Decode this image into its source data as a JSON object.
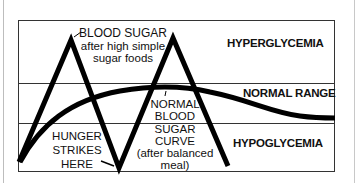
{
  "diagram": {
    "zones": {
      "hyperglycemia": "HYPERGLYCEMIA",
      "normal_range": "NORMAL RANGE",
      "hypoglycemia": "HYPOGLYCEMIA"
    },
    "annotations": {
      "high_sugar": {
        "line1": "BLOOD SUGAR",
        "line2": "after high simple",
        "line3": "sugar foods"
      },
      "hunger": {
        "line1": "HUNGER",
        "line2": "STRIKES",
        "line3": "HERE"
      },
      "normal_curve": {
        "line1": "NORMAL",
        "line2": "BLOOD",
        "line3": "SUGAR",
        "line4": "CURVE",
        "line5": "(after balanced",
        "line6": "meal)"
      }
    },
    "curves": [
      {
        "name": "high-simple-sugar-curve",
        "description": "zigzag spiking into hyperglycemia then crashing into hypoglycemia"
      },
      {
        "name": "normal-blood-sugar-curve",
        "description": "smooth rise into normal range and gradual decline"
      }
    ],
    "colors": {
      "line": "#000000",
      "frame": "#333333",
      "background": "#ffffff"
    }
  }
}
